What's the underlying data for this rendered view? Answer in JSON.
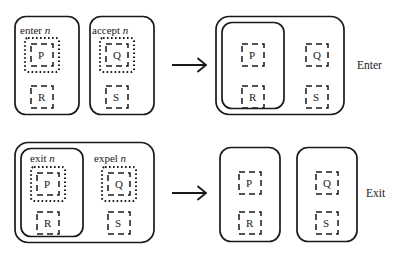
{
  "diagram": {
    "type": "process-calculus-transition",
    "rows": [
      {
        "id": "enter-rule",
        "side_label": "Enter",
        "arrow": "right-arrow",
        "left": {
          "membranes": [
            {
              "id": "enter-membrane",
              "action": {
                "verb": "enter",
                "name": "n"
              },
              "processes": [
                {
                  "label": "P",
                  "state": "active"
                },
                {
                  "label": "R",
                  "state": "inactive"
                }
              ]
            },
            {
              "id": "accept-membrane",
              "action": {
                "verb": "accept",
                "name": "n"
              },
              "processes": [
                {
                  "label": "Q",
                  "state": "active"
                },
                {
                  "label": "S",
                  "state": "inactive"
                }
              ]
            }
          ]
        },
        "right": {
          "membranes": [
            {
              "id": "outer-membrane",
              "nested": {
                "id": "inner-membrane",
                "processes": [
                  {
                    "label": "P",
                    "state": "inactive"
                  },
                  {
                    "label": "R",
                    "state": "inactive"
                  }
                ]
              },
              "processes": [
                {
                  "label": "Q",
                  "state": "inactive"
                },
                {
                  "label": "S",
                  "state": "inactive"
                }
              ]
            }
          ]
        }
      },
      {
        "id": "exit-rule",
        "side_label": "Exit",
        "arrow": "right-arrow",
        "left": {
          "membranes": [
            {
              "id": "outer-membrane",
              "nested": {
                "id": "inner-membrane",
                "action": {
                  "verb": "exit",
                  "name": "n"
                },
                "processes": [
                  {
                    "label": "P",
                    "state": "active"
                  },
                  {
                    "label": "R",
                    "state": "inactive"
                  }
                ]
              },
              "action": {
                "verb": "expel",
                "name": "n"
              },
              "processes": [
                {
                  "label": "Q",
                  "state": "active"
                },
                {
                  "label": "S",
                  "state": "inactive"
                }
              ]
            }
          ]
        },
        "right": {
          "membranes": [
            {
              "id": "left-membrane",
              "processes": [
                {
                  "label": "P",
                  "state": "inactive"
                },
                {
                  "label": "R",
                  "state": "inactive"
                }
              ]
            },
            {
              "id": "right-membrane",
              "processes": [
                {
                  "label": "Q",
                  "state": "inactive"
                },
                {
                  "label": "S",
                  "state": "inactive"
                }
              ]
            }
          ]
        }
      }
    ],
    "labels": {
      "enter_verb": "enter",
      "enter_name": "n",
      "accept_verb": "accept",
      "accept_name": "n",
      "exit_verb": "exit",
      "exit_name": "n",
      "expel_verb": "expel",
      "expel_name": "n",
      "P": "P",
      "Q": "Q",
      "R": "R",
      "S": "S",
      "enter_side": "Enter",
      "exit_side": "Exit"
    },
    "colors": {
      "stroke": "#1a1a1a",
      "background": "#ffffff",
      "text": "#1a1a1a"
    }
  }
}
